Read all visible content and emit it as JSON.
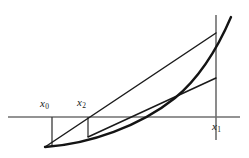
{
  "figure": {
    "type": "secant-method-diagram",
    "title": "",
    "background_color": "#ffffff",
    "width": 249,
    "height": 158,
    "labels": {
      "x0": {
        "base": "x",
        "sub": "0",
        "text": "x0"
      },
      "x2": {
        "base": "x",
        "sub": "2",
        "text": "x2"
      },
      "x1": {
        "base": "x",
        "sub": "1",
        "text": "x1"
      }
    },
    "colors": {
      "axis": "#6f6f6f",
      "curve": "#141414",
      "chord": "#1a1a1a",
      "drop": "#3a3a3a",
      "background": "#ffffff"
    }
  },
  "chart_data": {
    "type": "line",
    "title": "",
    "xlabel": "",
    "ylabel": "",
    "grid": false,
    "legend": false,
    "axis": {
      "x_axis": {
        "y": 117,
        "x_start": 8,
        "x_end": 240
      },
      "y_axis_vertical_at_x1": {
        "x": 216,
        "y_top": 15,
        "y_bottom": 140
      }
    },
    "points": {
      "x0": {
        "x": 52,
        "y_axis": 117,
        "y_curve": 147
      },
      "x2": {
        "x": 88,
        "y_axis": 117,
        "y_curve": 137
      },
      "x1": {
        "x": 216,
        "y_axis": 117,
        "y_curve": 33
      },
      "root_crossing": {
        "x": 140,
        "y": 117
      },
      "chord2_right_end": {
        "x": 216,
        "y": 78
      }
    },
    "series": [
      {
        "name": "f(x) curve",
        "kind": "curve",
        "path": "M 45 147 C 90 144, 140 126, 175 98 C 198 79, 216 52, 231 17"
      },
      {
        "name": "secant x0-x1",
        "kind": "chord",
        "from": [
          45,
          147
        ],
        "to": [
          216,
          33
        ]
      },
      {
        "name": "secant x2-x1",
        "kind": "chord",
        "from": [
          88,
          137
        ],
        "to": [
          216,
          78
        ]
      },
      {
        "name": "drop line x0",
        "kind": "vertical",
        "from": [
          52,
          117
        ],
        "to": [
          52,
          147
        ]
      },
      {
        "name": "drop line x2",
        "kind": "vertical",
        "from": [
          88,
          117
        ],
        "to": [
          88,
          137
        ]
      }
    ]
  }
}
